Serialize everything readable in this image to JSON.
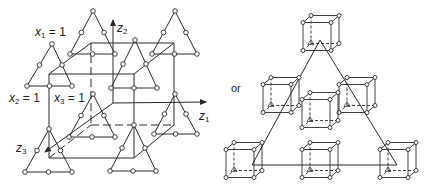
{
  "figure": {
    "colors": {
      "line": "#2a2a2a",
      "node_fill": "#ffffff",
      "background": "#ffffff"
    },
    "left_panel": {
      "labels": {
        "x1": {
          "var": "x",
          "sub": "1",
          "eq": " = 1"
        },
        "x2": {
          "var": "x",
          "sub": "2",
          "eq": " = 1"
        },
        "x3": {
          "var": "x",
          "sub": "3",
          "eq": " = 1"
        },
        "z1": {
          "var": "z",
          "sub": "1"
        },
        "z2": {
          "var": "z",
          "sub": "2"
        },
        "z3": {
          "var": "z",
          "sub": "3"
        }
      },
      "cube": {
        "front": [
          [
            49,
            74
          ],
          [
            134,
            74
          ],
          [
            134,
            158
          ],
          [
            49,
            158
          ]
        ],
        "back": [
          [
            91,
            43
          ],
          [
            174,
            43
          ],
          [
            174,
            125
          ],
          [
            91,
            125
          ]
        ]
      },
      "triangles": [
        {
          "name": "back-top-left",
          "apex": [
            93,
            11
          ],
          "left": [
            70,
            54
          ],
          "right": [
            115,
            54
          ]
        },
        {
          "name": "back-top-right",
          "apex": [
            175,
            11
          ],
          "left": [
            152,
            54
          ],
          "right": [
            197,
            54
          ]
        },
        {
          "name": "front-top-left",
          "apex": [
            52,
            44
          ],
          "left": [
            27,
            86
          ],
          "right": [
            72,
            86
          ]
        },
        {
          "name": "front-top-right",
          "apex": [
            135,
            40
          ],
          "left": [
            111,
            88
          ],
          "right": [
            157,
            88
          ]
        },
        {
          "name": "back-bottom-left",
          "apex": [
            93,
            94
          ],
          "left": [
            69,
            137
          ],
          "right": [
            115,
            137
          ]
        },
        {
          "name": "back-bottom-right",
          "apex": [
            175,
            94
          ],
          "left": [
            154,
            134
          ],
          "right": [
            197,
            134
          ]
        },
        {
          "name": "front-bottom-left",
          "apex": [
            49,
            129
          ],
          "left": [
            25,
            172
          ],
          "right": [
            72,
            172
          ]
        },
        {
          "name": "front-bottom-right",
          "apex": [
            134,
            125
          ],
          "left": [
            110,
            171
          ],
          "right": [
            156,
            171
          ]
        }
      ],
      "axes": {
        "origin": [
          113,
          103
        ],
        "z1_end": [
          206,
          102
        ],
        "z2_end": [
          113,
          20
        ],
        "z3_end": [
          45,
          152
        ]
      }
    },
    "connector_label": "or",
    "right_panel": {
      "triangle": {
        "apex": [
          320,
          40
        ],
        "left": [
          252,
          165
        ],
        "right": [
          397,
          165
        ]
      },
      "cubes": [
        {
          "name": "top",
          "center": [
            321,
            33
          ]
        },
        {
          "name": "mid-left",
          "center": [
            281,
            95
          ]
        },
        {
          "name": "mid-right",
          "center": [
            357,
            95
          ]
        },
        {
          "name": "center",
          "center": [
            320,
            110
          ]
        },
        {
          "name": "bottom-left",
          "center": [
            244,
            160
          ]
        },
        {
          "name": "bottom-middle",
          "center": [
            320,
            160
          ]
        },
        {
          "name": "bottom-right",
          "center": [
            398,
            160
          ]
        }
      ]
    }
  }
}
